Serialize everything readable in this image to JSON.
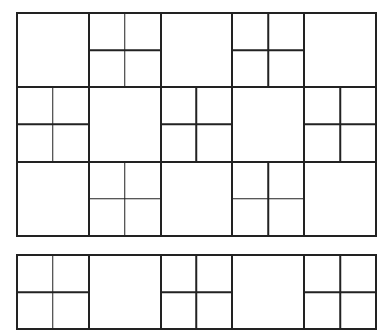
{
  "diagram": {
    "type": "square-tiling-pattern",
    "line_color": "#222222",
    "background_color": "#ffffff",
    "main_grid": {
      "columns": 5,
      "rows": 3,
      "cells": [
        [
          "solid",
          "quad",
          "solid",
          "quad",
          "solid"
        ],
        [
          "quad",
          "solid",
          "quad",
          "solid",
          "quad"
        ],
        [
          "solid",
          "quad",
          "solid",
          "quad",
          "solid"
        ]
      ]
    },
    "strip": {
      "columns": 5,
      "rows": 1,
      "cells": [
        [
          "quad",
          "solid",
          "quad",
          "solid",
          "quad"
        ]
      ]
    }
  }
}
